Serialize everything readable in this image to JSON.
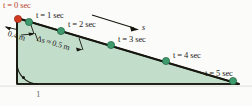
{
  "figure": {
    "name": "inclined-plane-time-marks",
    "colors": {
      "triangle_fill": "#c3ddcb",
      "triangle_edge": "#17170f",
      "ball_green": "#2f8a5f",
      "ball_red": "#d23a20",
      "label_text": "#1a1a18",
      "label_t0": "#b8402a",
      "background": "#fbfbf9"
    },
    "geometry": {
      "apex_x": 17,
      "apex_y": 18,
      "bottom_left_x": 17,
      "bottom_left_y": 84,
      "bottom_right_x": 239,
      "bottom_right_y": 84
    },
    "time_marks": [
      {
        "id": "t0",
        "label": "t = 0 sec",
        "t_symbol": "t",
        "eq": "= 0 sec",
        "ball_x": 18,
        "ball_y": 19,
        "color": "red",
        "label_x": 3,
        "label_y": 2
      },
      {
        "id": "t1",
        "label": "t = 1 sec",
        "t_symbol": "t",
        "eq": "= 1 sec",
        "ball_x": 29,
        "ball_y": 22,
        "color": "green",
        "label_x": 36,
        "label_y": 12
      },
      {
        "id": "t2",
        "label": "t = 2 sec",
        "t_symbol": "t",
        "eq": "= 2 sec",
        "ball_x": 61,
        "ball_y": 31,
        "color": "green",
        "label_x": 68,
        "label_y": 21
      },
      {
        "id": "t3",
        "label": "t = 3 sec",
        "t_symbol": "t",
        "eq": "= 3 sec",
        "ball_x": 111,
        "ball_y": 45,
        "color": "green",
        "label_x": 118,
        "label_y": 36
      },
      {
        "id": "t4",
        "label": "t = 4 sec",
        "t_symbol": "t",
        "eq": "= 4 sec",
        "ball_x": 166,
        "ball_y": 61,
        "color": "green",
        "label_x": 173,
        "label_y": 52
      },
      {
        "id": "t5",
        "label": "t = 5 sec",
        "t_symbol": "t",
        "eq": "= 5 sec",
        "ball_x": 233,
        "ball_y": 81,
        "color": "green",
        "label_x": 206,
        "label_y": 70
      }
    ],
    "dimensions": [
      {
        "id": "first-interval",
        "text": "0.4 m",
        "x": 9,
        "y": 33
      },
      {
        "id": "delta-s",
        "text": "Δs ≈ 0.5 m",
        "x": 38,
        "y": 39
      }
    ],
    "direction_arrow": {
      "label": "s",
      "label_x": 143,
      "label_y": 27,
      "x1": 92,
      "y1": 15,
      "x2": 138,
      "y2": 29
    },
    "right_angle_marker": {
      "present": true,
      "x": 17,
      "y": 84
    },
    "bottom_caption": {
      "fragment": "1",
      "x": 36,
      "y": 94
    }
  }
}
